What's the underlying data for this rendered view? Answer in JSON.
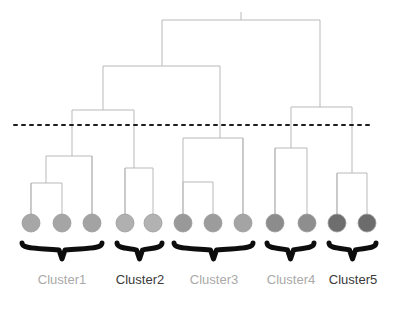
{
  "figure": {
    "type": "dendrogram",
    "title": "",
    "background_color": "#ffffff",
    "width": 401,
    "height": 315
  },
  "style": {
    "link_color": "#b9b9b9",
    "link_width": 1,
    "cut_line_color": "#1c1c1c",
    "brace_color": "#0d0d0d",
    "label_gray": "#a9a9a9",
    "label_dark": "#3a3a3a",
    "leaf_stroke": "#9a9a9a"
  },
  "cut_line": {
    "name": "threshold-cut-line",
    "y": 125,
    "x_start": 14,
    "x_end": 374,
    "dash": "3 5",
    "color": "#1c1c1c",
    "width": 2
  },
  "leaves": [
    {
      "id": "leaf-1",
      "cx": 31,
      "cy": 223,
      "r": 9,
      "fill": "#a7a7a7",
      "cluster": 1,
      "stem_top": 183
    },
    {
      "id": "leaf-2",
      "cx": 62,
      "cy": 223,
      "r": 9,
      "fill": "#a5a5a5",
      "cluster": 1,
      "stem_top": 183
    },
    {
      "id": "leaf-3",
      "cx": 92,
      "cy": 223,
      "r": 9,
      "fill": "#a3a3a3",
      "cluster": 1,
      "stem_top": 156
    },
    {
      "id": "leaf-4",
      "cx": 125,
      "cy": 223,
      "r": 9,
      "fill": "#b0b0b0",
      "cluster": 2,
      "stem_top": 168
    },
    {
      "id": "leaf-5",
      "cx": 153,
      "cy": 223,
      "r": 9,
      "fill": "#b2b2b2",
      "cluster": 2,
      "stem_top": 168
    },
    {
      "id": "leaf-6",
      "cx": 183,
      "cy": 223,
      "r": 9,
      "fill": "#999999",
      "cluster": 3,
      "stem_top": 182
    },
    {
      "id": "leaf-7",
      "cx": 213,
      "cy": 223,
      "r": 9,
      "fill": "#9c9c9c",
      "cluster": 3,
      "stem_top": 182
    },
    {
      "id": "leaf-8",
      "cx": 243,
      "cy": 223,
      "r": 9,
      "fill": "#a4a4a4",
      "cluster": 3,
      "stem_top": 138
    },
    {
      "id": "leaf-9",
      "cx": 275,
      "cy": 223,
      "r": 9,
      "fill": "#8c8c8c",
      "cluster": 4,
      "stem_top": 148
    },
    {
      "id": "leaf-10",
      "cx": 307,
      "cy": 223,
      "r": 9,
      "fill": "#8e8e8e",
      "cluster": 4,
      "stem_top": 148
    },
    {
      "id": "leaf-11",
      "cx": 337,
      "cy": 223,
      "r": 9,
      "fill": "#6e6e6e",
      "cluster": 5,
      "stem_top": 173
    },
    {
      "id": "leaf-12",
      "cx": 367,
      "cy": 223,
      "r": 9,
      "fill": "#6c6c6c",
      "cluster": 5,
      "stem_top": 173
    }
  ],
  "merges": [
    {
      "id": "merge-root",
      "y": 20,
      "x_left": 162,
      "x_right": 320,
      "stem_to": 66,
      "stem_x": 162,
      "stem_right_to": 107
    },
    {
      "id": "merge-l2-left",
      "y": 66,
      "x_left": 103,
      "x_right": 220,
      "stem_to": 110,
      "stem_x": 103,
      "stem_right_to": 138
    },
    {
      "id": "merge-c1",
      "y": 110,
      "x_left": 72,
      "x_right": 134,
      "stem_to": 156,
      "stem_x": 72,
      "stem_right_to": 168
    },
    {
      "id": "merge-c1-inner",
      "y": 156,
      "x_left": 46,
      "x_right": 92,
      "stem_to": 183,
      "stem_x": 46,
      "stem_right_to": 223
    },
    {
      "id": "merge-c1-pair",
      "y": 183,
      "x_left": 31,
      "x_right": 62,
      "stem_to": 223,
      "stem_x": 0,
      "stem_right_to": 0
    },
    {
      "id": "merge-c2",
      "y": 168,
      "x_left": 125,
      "x_right": 153,
      "stem_to": 223,
      "stem_x": 0,
      "stem_right_to": 0
    },
    {
      "id": "merge-c3",
      "y": 138,
      "x_left": 183,
      "x_right": 243,
      "stem_to": 182,
      "stem_x": 183,
      "stem_right_to": 223
    },
    {
      "id": "merge-c3-pair",
      "y": 182,
      "x_left": 183,
      "x_right": 213,
      "stem_to": 223,
      "stem_x": 0,
      "stem_right_to": 0
    },
    {
      "id": "merge-right",
      "y": 107,
      "x_left": 291,
      "x_right": 352,
      "stem_to": 148,
      "stem_x": 291,
      "stem_right_to": 173
    },
    {
      "id": "merge-c4",
      "y": 148,
      "x_left": 275,
      "x_right": 307,
      "stem_to": 223,
      "stem_x": 0,
      "stem_right_to": 0
    },
    {
      "id": "merge-c5",
      "y": 173,
      "x_left": 337,
      "x_right": 367,
      "stem_to": 223,
      "stem_x": 0,
      "stem_right_to": 0
    }
  ],
  "braces": [
    {
      "id": "brace-cluster-1",
      "x_start": 22,
      "x_end": 102,
      "y_top": 243,
      "y_bottom": 259
    },
    {
      "id": "brace-cluster-2",
      "x_start": 117,
      "x_end": 162,
      "y_top": 243,
      "y_bottom": 259
    },
    {
      "id": "brace-cluster-3",
      "x_start": 174,
      "x_end": 253,
      "y_top": 243,
      "y_bottom": 259
    },
    {
      "id": "brace-cluster-4",
      "x_start": 267,
      "x_end": 314,
      "y_top": 243,
      "y_bottom": 259
    },
    {
      "id": "brace-cluster-5",
      "x_start": 329,
      "x_end": 376,
      "y_top": 243,
      "y_bottom": 259
    }
  ],
  "cluster_labels": [
    {
      "name": "cluster-label-1",
      "text": "Cluster1",
      "cx": 62,
      "y": 272,
      "color": "#a9a9a9",
      "weight": "400",
      "members": 3
    },
    {
      "name": "cluster-label-2",
      "text": "Cluster2",
      "cx": 140,
      "y": 272,
      "color": "#3a3a3a",
      "weight": "400",
      "members": 2
    },
    {
      "name": "cluster-label-3",
      "text": "Cluster3",
      "cx": 214,
      "y": 272,
      "color": "#a9a9a9",
      "weight": "400",
      "members": 3
    },
    {
      "name": "cluster-label-4",
      "text": "Cluster4",
      "cx": 291,
      "y": 272,
      "color": "#a9a9a9",
      "weight": "400",
      "members": 2
    },
    {
      "name": "cluster-label-5",
      "text": "Cluster5",
      "cx": 353,
      "y": 272,
      "color": "#3a3a3a",
      "weight": "400",
      "members": 2
    }
  ],
  "chart_data": {
    "type": "dendrogram",
    "title": "",
    "xlabel": "",
    "ylabel": "",
    "n_leaves": 12,
    "n_clusters": 5,
    "cut_threshold_y": 125,
    "cluster_names": [
      "Cluster1",
      "Cluster2",
      "Cluster3",
      "Cluster4",
      "Cluster5"
    ],
    "cluster_sizes": [
      3,
      2,
      3,
      2,
      2
    ],
    "leaf_x_positions": [
      31,
      62,
      92,
      125,
      153,
      183,
      213,
      243,
      275,
      307,
      337,
      367
    ],
    "merge_heights_y": [
      20,
      66,
      107,
      110,
      138,
      148,
      156,
      168,
      173,
      182,
      183
    ]
  }
}
